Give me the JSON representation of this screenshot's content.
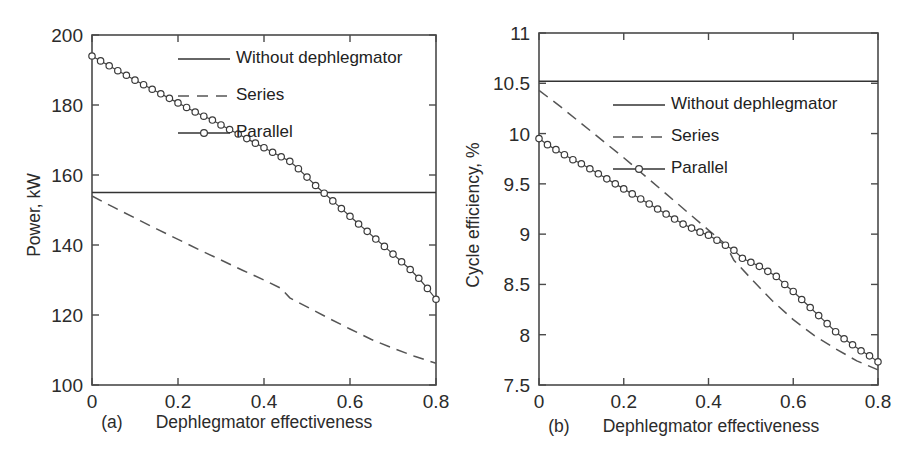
{
  "figure": {
    "panels": [
      {
        "tag": "(a)",
        "xlabel": "Dephlegmator effectiveness",
        "ylabel": "Power, kW",
        "legend": [
          "Without dephlegmator",
          "Series",
          "Parallel"
        ]
      },
      {
        "tag": "(b)",
        "xlabel": "Dephlegmator effectiveness",
        "ylabel": "Cycle efficiency, %",
        "legend": [
          "Without dephlegmator",
          "Series",
          "Parallel"
        ]
      }
    ]
  },
  "chart_data": [
    {
      "type": "line",
      "title": "",
      "panel": "(a)",
      "xlabel": "Dephlegmator effectiveness",
      "ylabel": "Power, kW",
      "xlim": [
        0,
        0.8
      ],
      "ylim": [
        100,
        200
      ],
      "xticks": [
        0,
        0.2,
        0.4,
        0.6,
        0.8
      ],
      "xticklabels": [
        "0",
        "0.2",
        "0.4",
        "0.6",
        "0.8"
      ],
      "yticks": [
        100,
        120,
        140,
        160,
        180,
        200
      ],
      "yticklabels": [
        "100",
        "120",
        "140",
        "160",
        "180",
        "200"
      ],
      "grid": false,
      "legend_position": "upper right inside",
      "series": [
        {
          "name": "Without dephlegmator",
          "style": "solid",
          "marker": "none",
          "x": [
            0,
            0.8
          ],
          "values": [
            155,
            155
          ]
        },
        {
          "name": "Series",
          "style": "dashed",
          "marker": "none",
          "x": [
            0,
            0.05,
            0.1,
            0.15,
            0.2,
            0.25,
            0.3,
            0.35,
            0.4,
            0.44,
            0.46,
            0.5,
            0.55,
            0.6,
            0.65,
            0.7,
            0.75,
            0.8
          ],
          "values": [
            154.0,
            150.8,
            147.7,
            144.6,
            141.6,
            138.6,
            135.7,
            132.8,
            130.0,
            127.6,
            124.9,
            122.3,
            119.1,
            116.0,
            113.0,
            110.5,
            108.2,
            106.2
          ]
        },
        {
          "name": "Parallel",
          "style": "solid",
          "marker": "circle",
          "x": [
            0,
            0.02,
            0.04,
            0.06,
            0.08,
            0.1,
            0.12,
            0.14,
            0.16,
            0.18,
            0.2,
            0.22,
            0.24,
            0.26,
            0.28,
            0.3,
            0.32,
            0.34,
            0.36,
            0.38,
            0.4,
            0.42,
            0.44,
            0.46,
            0.48,
            0.5,
            0.52,
            0.54,
            0.56,
            0.58,
            0.6,
            0.62,
            0.64,
            0.66,
            0.68,
            0.7,
            0.72,
            0.74,
            0.76,
            0.78,
            0.8
          ],
          "values": [
            194.0,
            192.6,
            191.2,
            189.8,
            188.5,
            187.1,
            185.8,
            184.5,
            183.2,
            181.9,
            180.6,
            179.3,
            178.0,
            176.8,
            175.7,
            174.3,
            173.0,
            171.7,
            170.4,
            169.1,
            167.8,
            166.5,
            165.2,
            163.9,
            161.8,
            159.4,
            157.0,
            154.8,
            152.6,
            150.4,
            148.2,
            146.0,
            143.9,
            141.7,
            139.6,
            137.4,
            135.2,
            133.0,
            130.5,
            127.6,
            124.5
          ]
        }
      ]
    },
    {
      "type": "line",
      "title": "",
      "panel": "(b)",
      "xlabel": "Dephlegmator effectiveness",
      "ylabel": "Cycle efficiency, %",
      "xlim": [
        0,
        0.8
      ],
      "ylim": [
        7.5,
        11
      ],
      "xticks": [
        0,
        0.2,
        0.4,
        0.6,
        0.8
      ],
      "xticklabels": [
        "0",
        "0.2",
        "0.4",
        "0.6",
        "0.8"
      ],
      "yticks": [
        7.5,
        8,
        8.5,
        9,
        9.5,
        10,
        10.5,
        11
      ],
      "yticklabels": [
        "7.5",
        "8",
        "8.5",
        "9",
        "9.5",
        "10",
        "10.5",
        "11"
      ],
      "grid": false,
      "legend_position": "upper right outside",
      "series": [
        {
          "name": "Without dephlegmator",
          "style": "solid",
          "marker": "none",
          "x": [
            0,
            0.8
          ],
          "values": [
            10.52,
            10.52
          ]
        },
        {
          "name": "Series",
          "style": "dashed",
          "marker": "none",
          "x": [
            0,
            0.05,
            0.1,
            0.15,
            0.2,
            0.25,
            0.3,
            0.35,
            0.4,
            0.44,
            0.46,
            0.5,
            0.55,
            0.6,
            0.65,
            0.7,
            0.75,
            0.8
          ],
          "values": [
            10.43,
            10.27,
            10.1,
            9.93,
            9.76,
            9.58,
            9.4,
            9.22,
            9.04,
            8.9,
            8.74,
            8.56,
            8.34,
            8.15,
            7.99,
            7.86,
            7.74,
            7.65
          ]
        },
        {
          "name": "Parallel",
          "style": "solid",
          "marker": "circle",
          "x": [
            0,
            0.02,
            0.04,
            0.06,
            0.08,
            0.1,
            0.12,
            0.14,
            0.16,
            0.18,
            0.2,
            0.22,
            0.24,
            0.26,
            0.28,
            0.3,
            0.32,
            0.34,
            0.36,
            0.38,
            0.4,
            0.42,
            0.44,
            0.46,
            0.48,
            0.5,
            0.52,
            0.54,
            0.56,
            0.58,
            0.6,
            0.62,
            0.64,
            0.66,
            0.68,
            0.7,
            0.72,
            0.74,
            0.76,
            0.78,
            0.8
          ],
          "values": [
            9.95,
            9.89,
            9.84,
            9.79,
            9.74,
            9.7,
            9.65,
            9.6,
            9.55,
            9.5,
            9.45,
            9.4,
            9.35,
            9.3,
            9.25,
            9.2,
            9.15,
            9.1,
            9.06,
            9.02,
            8.99,
            8.94,
            8.89,
            8.84,
            8.76,
            8.72,
            8.68,
            8.63,
            8.58,
            8.5,
            8.43,
            8.35,
            8.27,
            8.19,
            8.11,
            8.03,
            7.96,
            7.9,
            7.84,
            7.79,
            7.73
          ]
        }
      ]
    }
  ]
}
